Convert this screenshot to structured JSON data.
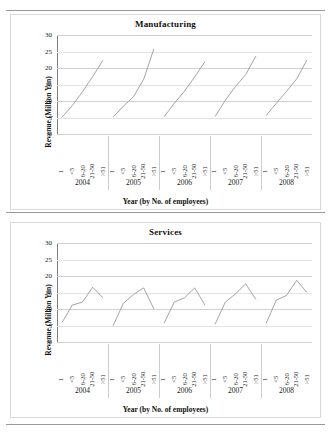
{
  "chart_data": [
    {
      "type": "line",
      "title": "Manufacturing",
      "xlabel": "Year (by No. of employees)",
      "ylabel": "Revenue (Million Yen)",
      "ylim": [
        0,
        30
      ],
      "yticks": [
        0,
        5,
        10,
        15,
        20,
        25,
        30
      ],
      "grid": true,
      "legend": "none",
      "categories": [
        "1",
        "<5",
        "6-20",
        "21-50",
        ">51"
      ],
      "groups": [
        "2004",
        "2005",
        "2006",
        "2007",
        "2008"
      ],
      "series": [
        {
          "name": "2004",
          "values": [
            5.1,
            8.6,
            12.8,
            17.4,
            22.3
          ]
        },
        {
          "name": "2005",
          "values": [
            5.1,
            8.4,
            11.3,
            16.6,
            25.8
          ]
        },
        {
          "name": "2006",
          "values": [
            5.2,
            9.3,
            13.0,
            17.3,
            21.9
          ]
        },
        {
          "name": "2007",
          "values": [
            5.3,
            10.2,
            14.4,
            18.0,
            23.6
          ]
        },
        {
          "name": "2008",
          "values": [
            5.6,
            9.3,
            12.9,
            16.7,
            22.4
          ]
        }
      ]
    },
    {
      "type": "line",
      "title": "Services",
      "xlabel": "Year (by No. of employees)",
      "ylabel": "Revenue (Million Yen)",
      "ylim": [
        0,
        30
      ],
      "yticks": [
        0,
        5,
        10,
        15,
        20,
        25,
        30
      ],
      "grid": true,
      "legend": "none",
      "categories": [
        "1",
        "<5",
        "6-20",
        "21-50",
        ">51"
      ],
      "groups": [
        "2004",
        "2005",
        "2006",
        "2007",
        "2008"
      ],
      "series": [
        {
          "name": "2004",
          "values": [
            5.9,
            11.2,
            12.1,
            16.6,
            13.4
          ]
        },
        {
          "name": "2005",
          "values": [
            4.9,
            11.7,
            14.4,
            16.4,
            10.0
          ]
        },
        {
          "name": "2006",
          "values": [
            5.7,
            12.1,
            13.4,
            16.4,
            11.2
          ]
        },
        {
          "name": "2007",
          "values": [
            5.4,
            12.1,
            14.6,
            17.6,
            12.9
          ]
        },
        {
          "name": "2008",
          "values": [
            5.6,
            12.7,
            14.1,
            18.7,
            15.0
          ]
        }
      ]
    }
  ],
  "panels": [
    {
      "title": "Manufacturing",
      "ylabel": "Revenue (Million Yen)",
      "xlabel": "Year (by No. of employees)",
      "yticks": [
        "30",
        "25",
        "20",
        "15",
        "10",
        "5",
        "0"
      ],
      "categories": [
        "1",
        "<5",
        "6-20",
        "21-50",
        ">51"
      ],
      "years": [
        "2004",
        "2005",
        "2006",
        "2007",
        "2008"
      ]
    },
    {
      "title": "Services",
      "ylabel": "Revenue (Million Yen)",
      "xlabel": "Year (by No. of employees)",
      "yticks": [
        "30",
        "25",
        "20",
        "15",
        "10",
        "5",
        "0"
      ],
      "categories": [
        "1",
        "<5",
        "6-20",
        "21-50",
        ">51"
      ],
      "years": [
        "2004",
        "2005",
        "2006",
        "2007",
        "2008"
      ]
    }
  ]
}
